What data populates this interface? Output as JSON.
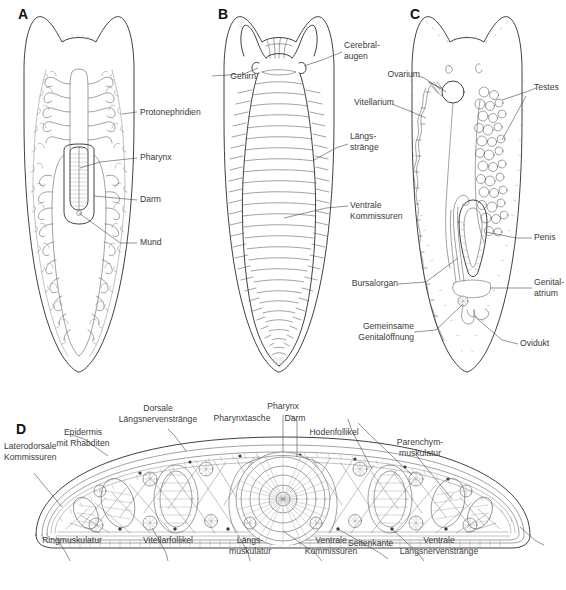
{
  "figure": {
    "type": "scientific-anatomical-plate",
    "language": "de",
    "background_color": "#ffffff",
    "ink_color": "#2b2b2b",
    "label_color": "#3b3b3b"
  },
  "panels": [
    {
      "id": "A",
      "letter": "A",
      "title": "A",
      "description": "Protonephridial- und Darmsystem, Dorsalansicht",
      "labels": [
        {
          "name": "protonephridien",
          "text": "Protonephridien"
        },
        {
          "name": "pharynx",
          "text": "Pharynx"
        },
        {
          "name": "darm",
          "text": "Darm"
        },
        {
          "name": "mund",
          "text": "Mund"
        }
      ]
    },
    {
      "id": "B",
      "letter": "B",
      "title": "B",
      "description": "Nervensystem, Dorsalansicht",
      "labels": [
        {
          "name": "gehirn",
          "text": "Gehirn"
        },
        {
          "name": "cerebralaugen",
          "text": "Cerebral-\naugen"
        },
        {
          "name": "laengsstraenge",
          "text": "Längs-\nstränge"
        },
        {
          "name": "ventrale-kommissuren",
          "text": "Ventrale\nKommissuren"
        }
      ]
    },
    {
      "id": "C",
      "letter": "C",
      "title": "C",
      "description": "Geschlechtsorgane",
      "labels": [
        {
          "name": "ovarium",
          "text": "Ovarium"
        },
        {
          "name": "vitellarium",
          "text": "Vitellarium"
        },
        {
          "name": "testes",
          "text": "Testes"
        },
        {
          "name": "penis",
          "text": "Penis"
        },
        {
          "name": "bursalorgan",
          "text": "Bursalorgan"
        },
        {
          "name": "genitalatrium",
          "text": "Genital-\natrium"
        },
        {
          "name": "gemeinsame-genitaloeffnung",
          "text": "Gemeinsame\nGenitalöffnung"
        },
        {
          "name": "ovidukt",
          "text": "Ovidukt"
        }
      ]
    },
    {
      "id": "D",
      "letter": "D",
      "title": "D",
      "description": "Querschnitt durch den Körper in Höhe des Pharynx",
      "labels": [
        {
          "name": "epidermis-mit-rhabditen",
          "text": "Epidermis\nmit Rhabditen"
        },
        {
          "name": "dorsale-laengsnervenstraenge",
          "text": "Dorsale\nLängsnervenstränge"
        },
        {
          "name": "pharynx",
          "text": "Pharynx"
        },
        {
          "name": "pharynxtasche",
          "text": "Pharynxtasche"
        },
        {
          "name": "darm",
          "text": "Darm"
        },
        {
          "name": "hodenfollikel",
          "text": "Hodenfollikel"
        },
        {
          "name": "parenchymmuskulatur",
          "text": "Parenchym-\nmuskulatur"
        },
        {
          "name": "laterodorsale-kommissuren",
          "text": "Laterodorsale\nKommissuren"
        },
        {
          "name": "seitenkante",
          "text": "Seitenkante"
        },
        {
          "name": "ringmuskulatur",
          "text": "Ringmuskulatur"
        },
        {
          "name": "vitellarfollikel",
          "text": "Vitellarfollikel"
        },
        {
          "name": "laengsmuskulatur",
          "text": "Längs-\nmuskulatur"
        },
        {
          "name": "ventrale-kommissuren",
          "text": "Ventrale\nKommissuren"
        },
        {
          "name": "ventrale-laengsnervenstraenge",
          "text": "Ventrale\nLängsnervenstränge"
        }
      ]
    }
  ],
  "caption": {
    "text": "",
    "visible": false
  }
}
